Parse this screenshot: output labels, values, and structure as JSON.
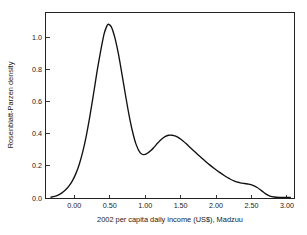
{
  "chart_data": {
    "type": "line",
    "title": "",
    "subtitle": "",
    "xlabel": "2002 per capita daily income (US$), Madzuu",
    "ylabel": "Rosenblatt-Parzen density",
    "xlim": [
      -0.4,
      3.1
    ],
    "ylim": [
      0.0,
      1.15
    ],
    "xticks": [
      0.0,
      0.5,
      1.0,
      1.5,
      2.0,
      2.5,
      3.0
    ],
    "xticklabels": [
      "0.00",
      "0.50",
      "1.00",
      "1.50",
      "2.00",
      "2.50",
      "3.00"
    ],
    "yticks": [
      0.0,
      0.2,
      0.4,
      0.6,
      0.8,
      1.0
    ],
    "yticklabels": [
      "0.0",
      "0.2",
      "0.4",
      "0.6",
      "0.8",
      "1.0"
    ],
    "grid": false,
    "legend": null,
    "legend_position": "none",
    "frame": "full-box",
    "annotations": [],
    "series": [
      {
        "name": "Rosenblatt-Parzen kernel density estimate",
        "color": "#111111",
        "linewidth": 1.35,
        "x": [
          -0.33,
          -0.28,
          -0.23,
          -0.18,
          -0.13,
          -0.08,
          -0.03,
          0.02,
          0.07,
          0.12,
          0.17,
          0.22,
          0.27,
          0.32,
          0.37,
          0.42,
          0.46,
          0.48,
          0.52,
          0.57,
          0.62,
          0.67,
          0.72,
          0.77,
          0.82,
          0.87,
          0.93,
          0.98,
          1.03,
          1.08,
          1.13,
          1.18,
          1.23,
          1.28,
          1.33,
          1.38,
          1.43,
          1.48,
          1.53,
          1.58,
          1.63,
          1.7,
          1.77,
          1.84,
          1.91,
          1.98,
          2.05,
          2.12,
          2.19,
          2.26,
          2.33,
          2.4,
          2.46,
          2.52,
          2.58,
          2.64,
          2.7,
          2.76,
          2.82,
          2.9,
          3.0,
          3.05
        ],
        "y": [
          0.005,
          0.01,
          0.018,
          0.03,
          0.048,
          0.072,
          0.105,
          0.15,
          0.21,
          0.29,
          0.39,
          0.51,
          0.645,
          0.785,
          0.91,
          1.02,
          1.07,
          1.08,
          1.065,
          1.0,
          0.9,
          0.775,
          0.645,
          0.52,
          0.415,
          0.335,
          0.28,
          0.27,
          0.278,
          0.295,
          0.318,
          0.343,
          0.365,
          0.381,
          0.39,
          0.39,
          0.384,
          0.372,
          0.356,
          0.337,
          0.316,
          0.288,
          0.259,
          0.232,
          0.206,
          0.182,
          0.159,
          0.138,
          0.12,
          0.105,
          0.096,
          0.09,
          0.086,
          0.078,
          0.065,
          0.046,
          0.026,
          0.012,
          0.006,
          0.004,
          0.004,
          0.004
        ]
      }
    ],
    "peaks": [
      {
        "label": "primary mode",
        "x": 0.48,
        "y": 1.08
      },
      {
        "label": "local minimum",
        "x": 0.95,
        "y": 0.27
      },
      {
        "label": "secondary mode",
        "x": 1.33,
        "y": 0.39
      },
      {
        "label": "tail shoulder",
        "x": 2.38,
        "y": 0.09
      }
    ]
  },
  "colors": {
    "background": "#ffffff",
    "axis": "#222222",
    "curve": "#111111",
    "text": "#1a1a1a"
  }
}
